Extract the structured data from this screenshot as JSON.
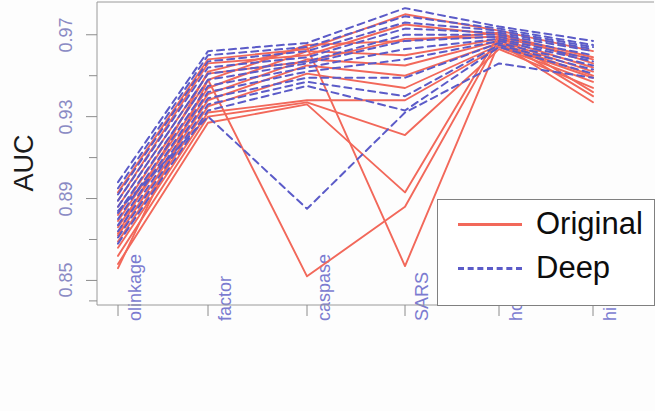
{
  "chart_data": {
    "type": "line",
    "title": "",
    "subtitle": "",
    "xlabel": "",
    "ylabel": "AUC",
    "ylim": [
      0.838,
      0.986
    ],
    "xlim": [
      0,
      7
    ],
    "grid": false,
    "legend_position": "bottom-right",
    "y_ticks_major": [
      0.97,
      0.93,
      0.89,
      0.85
    ],
    "y_ticks_minor": [
      0.99,
      0.95,
      0.91,
      0.87,
      0.84
    ],
    "categories": [
      "olinkage",
      "factor",
      "caspase",
      "SARS",
      "hcv",
      "hi"
    ],
    "legend": [
      {
        "name": "Original",
        "color": "#f2685a",
        "style": "solid"
      },
      {
        "name": "Deep",
        "color": "#5b5bc8",
        "style": "dashed"
      }
    ],
    "series": [
      {
        "name": "Original 1",
        "group": "Original",
        "values": [
          0.893,
          0.958,
          0.963,
          0.98,
          0.972,
          0.962
        ]
      },
      {
        "name": "Original 2",
        "group": "Original",
        "values": [
          0.889,
          0.956,
          0.96,
          0.975,
          0.97,
          0.959
        ]
      },
      {
        "name": "Original 3",
        "group": "Original",
        "values": [
          0.886,
          0.951,
          0.957,
          0.968,
          0.969,
          0.958
        ]
      },
      {
        "name": "Original 4",
        "group": "Original",
        "values": [
          0.882,
          0.948,
          0.965,
          0.967,
          0.971,
          0.956
        ]
      },
      {
        "name": "Original 5",
        "group": "Original",
        "values": [
          0.879,
          0.944,
          0.962,
          0.96,
          0.968,
          0.954
        ]
      },
      {
        "name": "Original 6",
        "group": "Original",
        "values": [
          0.876,
          0.941,
          0.958,
          0.955,
          0.967,
          0.952
        ]
      },
      {
        "name": "Original 7",
        "group": "Original",
        "values": [
          0.872,
          0.938,
          0.955,
          0.95,
          0.966,
          0.95
        ]
      },
      {
        "name": "Original 8",
        "group": "Original",
        "values": [
          0.869,
          0.935,
          0.951,
          0.944,
          0.965,
          0.949
        ]
      },
      {
        "name": "Original 9",
        "group": "Original",
        "values": [
          0.866,
          0.932,
          0.938,
          0.938,
          0.964,
          0.947
        ]
      },
      {
        "name": "Original 10",
        "group": "Original",
        "values": [
          0.862,
          0.93,
          0.937,
          0.921,
          0.963,
          0.944
        ]
      },
      {
        "name": "Original 11",
        "group": "Original",
        "values": [
          0.858,
          0.927,
          0.936,
          0.893,
          0.97,
          0.942
        ]
      },
      {
        "name": "Original 12",
        "group": "Original",
        "values": [
          0.856,
          0.948,
          0.852,
          0.886,
          0.968,
          0.94
        ]
      },
      {
        "name": "Original 13",
        "group": "Original",
        "values": [
          0.873,
          0.952,
          0.964,
          0.857,
          0.966,
          0.937
        ]
      },
      {
        "name": "Deep 1",
        "group": "Deep",
        "values": [
          0.898,
          0.962,
          0.966,
          0.983,
          0.974,
          0.967
        ]
      },
      {
        "name": "Deep 2",
        "group": "Deep",
        "values": [
          0.895,
          0.96,
          0.964,
          0.979,
          0.973,
          0.965
        ]
      },
      {
        "name": "Deep 3",
        "group": "Deep",
        "values": [
          0.892,
          0.957,
          0.962,
          0.976,
          0.972,
          0.964
        ]
      },
      {
        "name": "Deep 4",
        "group": "Deep",
        "values": [
          0.889,
          0.954,
          0.959,
          0.973,
          0.971,
          0.963
        ]
      },
      {
        "name": "Deep 5",
        "group": "Deep",
        "values": [
          0.886,
          0.951,
          0.957,
          0.97,
          0.97,
          0.962
        ]
      },
      {
        "name": "Deep 6",
        "group": "Deep",
        "values": [
          0.883,
          0.948,
          0.956,
          0.967,
          0.969,
          0.96
        ]
      },
      {
        "name": "Deep 7",
        "group": "Deep",
        "values": [
          0.88,
          0.945,
          0.954,
          0.963,
          0.968,
          0.958
        ]
      },
      {
        "name": "Deep 8",
        "group": "Deep",
        "values": [
          0.877,
          0.942,
          0.952,
          0.958,
          0.967,
          0.957
        ]
      },
      {
        "name": "Deep 9",
        "group": "Deep",
        "values": [
          0.874,
          0.939,
          0.949,
          0.949,
          0.966,
          0.955
        ]
      },
      {
        "name": "Deep 10",
        "group": "Deep",
        "values": [
          0.871,
          0.936,
          0.947,
          0.94,
          0.965,
          0.953
        ]
      },
      {
        "name": "Deep 11",
        "group": "Deep",
        "values": [
          0.868,
          0.933,
          0.945,
          0.933,
          0.964,
          0.951
        ]
      },
      {
        "name": "Deep 12",
        "group": "Deep",
        "values": [
          0.884,
          0.93,
          0.885,
          0.932,
          0.956,
          0.949
        ]
      }
    ]
  },
  "axes": {
    "y_label": "AUC",
    "y_tick_labels": [
      "0.97",
      "0.93",
      "0.89",
      "0.85"
    ],
    "x_tick_labels": [
      "olinkage",
      "factor",
      "caspase",
      "SARS",
      "hcv",
      "hi"
    ]
  },
  "legend": {
    "original_label": "Original",
    "deep_label": "Deep"
  }
}
